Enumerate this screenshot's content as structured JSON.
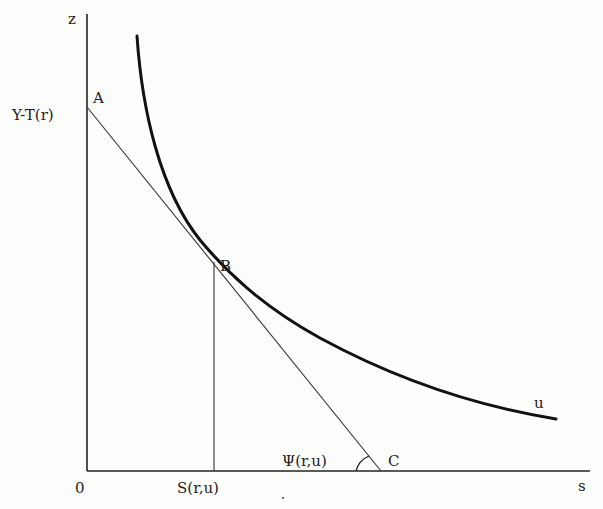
{
  "labels": {
    "z_axis": "z",
    "s_axis": "s",
    "origin": "0",
    "point_a": "A",
    "point_b": "B",
    "point_c": "C",
    "intercept": "Y-T(r)",
    "s_value": "S(r,u)",
    "angle": "Ψ(r,u)",
    "curve": "u"
  },
  "colors": {
    "ink": "#1a1a1a",
    "thin": "#333333",
    "background": "#fdfdfb"
  }
}
